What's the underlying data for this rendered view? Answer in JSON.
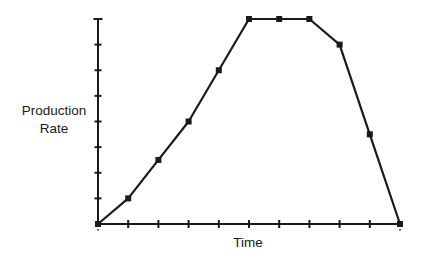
{
  "chart_data": {
    "type": "line",
    "title": "",
    "xlabel": "Time",
    "ylabel_lines": [
      "Production",
      "Rate"
    ],
    "ylabel": "Production Rate",
    "x": [
      0,
      1,
      2,
      3,
      4,
      5,
      6,
      7,
      8,
      9,
      10
    ],
    "series": [
      {
        "name": "Production Rate",
        "values": [
          0,
          1,
          2.5,
          4,
          6,
          8,
          8,
          8,
          7,
          3.5,
          0
        ],
        "marker": "square",
        "color": "#1a1a1a"
      }
    ],
    "xlim": [
      0,
      10
    ],
    "ylim": [
      0,
      8
    ],
    "x_ticks": 10,
    "y_ticks": 8,
    "tick_labels_shown": false,
    "grid": false,
    "legend": null
  },
  "colors": {
    "line": "#1a1a1a",
    "axis": "#1a1a1a",
    "background": "#ffffff"
  }
}
